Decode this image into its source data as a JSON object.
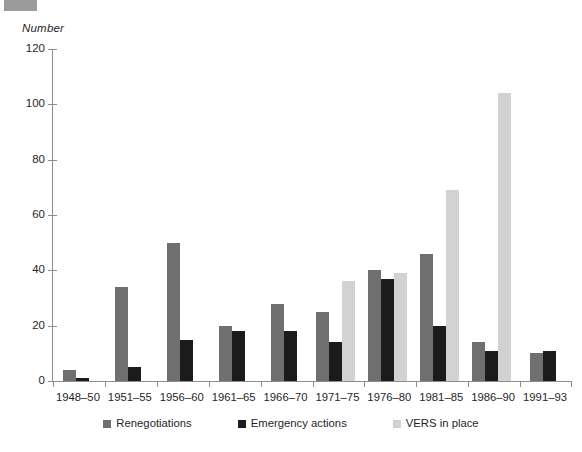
{
  "chart_data": {
    "type": "bar",
    "title": "",
    "xlabel": "",
    "ylabel": "Number",
    "ylim": [
      0,
      120
    ],
    "yticks": [
      0,
      20,
      40,
      60,
      80,
      100,
      120
    ],
    "grid": false,
    "legend_position": "bottom",
    "categories": [
      "1948–50",
      "1951–55",
      "1956–60",
      "1961–65",
      "1966–70",
      "1971–75",
      "1976–80",
      "1981–85",
      "1986–90",
      "1991–93"
    ],
    "series": [
      {
        "name": "Renegotiations",
        "color": "#6f6f6f",
        "values": [
          4,
          34,
          50,
          20,
          28,
          25,
          40,
          46,
          14,
          10
        ]
      },
      {
        "name": "Emergency actions",
        "color": "#1b1b1b",
        "values": [
          1,
          5,
          15,
          18,
          18,
          14,
          37,
          20,
          11,
          11
        ]
      },
      {
        "name": "VERS in place",
        "color": "#d2d2d2",
        "values": [
          null,
          null,
          null,
          null,
          null,
          36,
          39,
          69,
          104,
          null
        ]
      }
    ]
  },
  "legend": {
    "items": [
      {
        "label": "Renegotiations",
        "swatch": "series-reneg"
      },
      {
        "label": "Emergency actions",
        "swatch": "series-emerg"
      },
      {
        "label": "VERS in place",
        "swatch": "series-vers"
      }
    ]
  }
}
